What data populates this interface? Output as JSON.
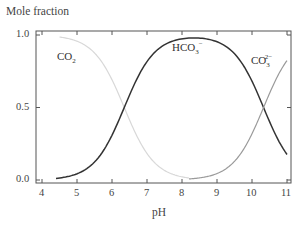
{
  "chart_data": {
    "type": "line",
    "title": "",
    "xlabel": "pH",
    "ylabel": "Mole fraction",
    "xlim": [
      3.8,
      11.1
    ],
    "ylim": [
      -0.03,
      1.03
    ],
    "xticks": [
      "4",
      "5",
      "6",
      "7",
      "8",
      "9",
      "10",
      "11"
    ],
    "yticks": [
      "0.0",
      "0.5",
      "1.0"
    ],
    "grid": false,
    "legend": "inline labels",
    "pKa1": 6.35,
    "pKa2": 10.33,
    "series": [
      {
        "name": "CO2",
        "label_main": "CO",
        "label_sub": "2",
        "label_sup": "",
        "color": "#d8d8d8",
        "x": [
          4.5,
          5.0,
          5.5,
          6.0,
          6.35,
          6.5,
          7.0,
          7.5,
          8.0,
          8.2
        ],
        "values": [
          0.99,
          0.96,
          0.88,
          0.69,
          0.5,
          0.41,
          0.18,
          0.07,
          0.02,
          0.01
        ]
      },
      {
        "name": "HCO3-",
        "label_main": "HCO",
        "label_sub": "3",
        "label_sup": "−",
        "color": "#333333",
        "x": [
          4.4,
          5.0,
          5.5,
          6.0,
          6.35,
          6.5,
          7.0,
          7.5,
          8.0,
          8.34,
          8.5,
          9.0,
          9.5,
          10.0,
          10.33,
          10.5,
          11.0
        ],
        "values": [
          0.01,
          0.04,
          0.12,
          0.31,
          0.5,
          0.58,
          0.82,
          0.93,
          0.97,
          0.98,
          0.97,
          0.93,
          0.82,
          0.68,
          0.5,
          0.4,
          0.18
        ]
      },
      {
        "name": "CO3^2-",
        "label_main": "CO",
        "label_sub": "3",
        "label_sup": "2−",
        "color": "#9a9a9a",
        "x": [
          8.2,
          8.5,
          9.0,
          9.5,
          10.0,
          10.33,
          10.5,
          11.0
        ],
        "values": [
          0.01,
          0.02,
          0.05,
          0.13,
          0.32,
          0.5,
          0.6,
          0.82
        ]
      }
    ]
  }
}
